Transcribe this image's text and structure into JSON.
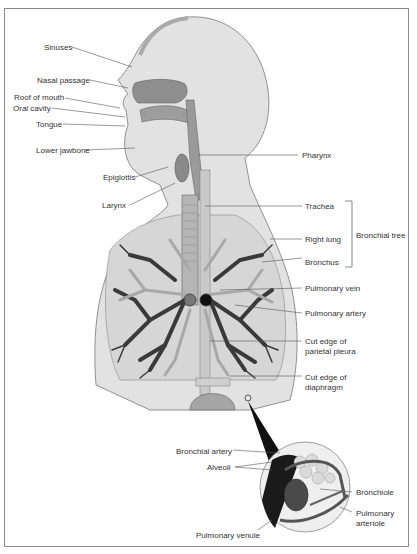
{
  "figure": {
    "labels_left": {
      "sinuses": "Sinuses",
      "nasal_passage": "Nasal passage",
      "roof_of_mouth": "Roof of mouth",
      "oral_cavity": "Oral cavity",
      "tongue": "Tongue",
      "lower_jawbone": "Lower jawbone",
      "epiglottis": "Epiglottis",
      "larynx": "Larynx"
    },
    "labels_right": {
      "pharynx": "Pharynx",
      "trachea": "Trachea",
      "right_lung": "Right lung",
      "bronchus": "Bronchus",
      "bronchial_tree": "Bronchial tree",
      "pulmonary_vein": "Pulmonary vein",
      "pulmonary_artery": "Pulmonary artery",
      "cut_edge_pleura_1": "Cut edge of",
      "cut_edge_pleura_2": "parietal pleura",
      "cut_edge_diaphragm_1": "Cut edge of",
      "cut_edge_diaphragm_2": "diaphragm"
    },
    "inset_labels": {
      "bronchial_artery": "Bronchial artery",
      "alveoli": "Alveoli",
      "bronchiole": "Bronchiole",
      "pulmonary_arteriole_1": "Pulmonary",
      "pulmonary_arteriole_2": "arteriole",
      "pulmonary_venule": "Pulmonary venule"
    },
    "colors": {
      "body_fill": "#e2e2e2",
      "lung_fill": "#d6d6d6",
      "airway": "#9a9a9a",
      "vessel_dark": "#3a3a3a",
      "vessel_light": "#a8a8a8",
      "frame": "#8a8a8a",
      "leader_line": "#555555"
    }
  }
}
